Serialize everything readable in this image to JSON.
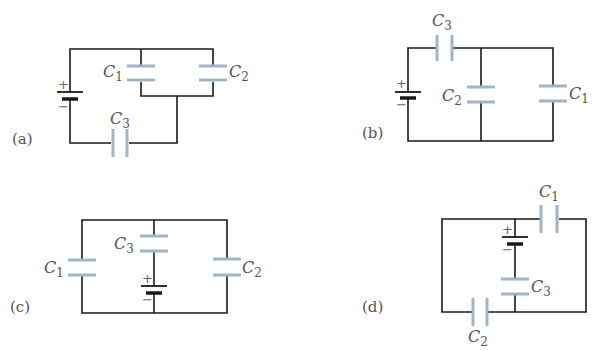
{
  "figure": {
    "panels": [
      {
        "tag": "(a)",
        "capacitors": [
          "C",
          "C",
          "C"
        ],
        "subs": [
          "1",
          "2",
          "3"
        ],
        "description": "C1 parallel C2, in series with C3 and battery"
      },
      {
        "tag": "(b)",
        "capacitors": [
          "C",
          "C",
          "C"
        ],
        "subs": [
          "3",
          "2",
          "1"
        ],
        "description": "C3 in series with C2 parallel C1 and battery"
      },
      {
        "tag": "(c)",
        "capacitors": [
          "C",
          "C",
          "C"
        ],
        "subs": [
          "1",
          "3",
          "2"
        ],
        "description": "C3 with battery in middle branch, C1 and C2 side branches"
      },
      {
        "tag": "(d)",
        "capacitors": [
          "C",
          "C",
          "C"
        ],
        "subs": [
          "1",
          "3",
          "2"
        ],
        "description": "Battery and C3 in middle branch, C1 top right, C2 bottom left"
      }
    ],
    "battery": {
      "plus": "+",
      "minus": "−"
    },
    "colors": {
      "wire": "#1a1a1a",
      "capacitor": "#9fb4c8",
      "text": "#555555"
    }
  }
}
